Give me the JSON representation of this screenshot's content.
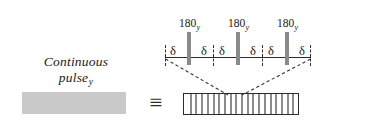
{
  "figure": {
    "width": 371,
    "height": 131,
    "background": "#ffffff",
    "ink_color": "#1a1a1a",
    "pulse_gray": "#8a8a8a",
    "block_gray": "#c9c9c9"
  },
  "left": {
    "caption_line1": "Continuous",
    "caption_line2": "pulse",
    "caption_subscript": "y",
    "block_name": "continuous-pulse-block"
  },
  "equivalence": {
    "symbol": "≡"
  },
  "comb": {
    "tooth_count": 20,
    "left": 183,
    "top": 93,
    "width": 116,
    "height": 22
  },
  "sequence": {
    "pulses": [
      {
        "label": "180",
        "subscript": "y",
        "x": 29
      },
      {
        "label": "180",
        "subscript": "y",
        "x": 78
      },
      {
        "label": "180",
        "subscript": "y",
        "x": 127
      }
    ],
    "delays": [
      {
        "label": "δ",
        "x": 13
      },
      {
        "label": "δ",
        "x": 44
      },
      {
        "label": "δ",
        "x": 62
      },
      {
        "label": "δ",
        "x": 93
      },
      {
        "label": "δ",
        "x": 111
      },
      {
        "label": "δ",
        "x": 142
      }
    ],
    "group_ticks": [
      5,
      53,
      102,
      150
    ],
    "baseline_label": "sequence-baseline"
  },
  "connectors": {
    "left_dashed": "from baseline left end to comb upper-left expansion point",
    "right_dashed": "from baseline right end to comb upper-right expansion point",
    "color": "#333333"
  }
}
